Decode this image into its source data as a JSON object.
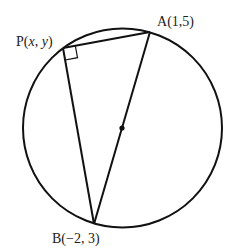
{
  "diagram": {
    "type": "circle-geometry",
    "circle": {
      "cx": 122.5,
      "cy": 128,
      "r": 99.5
    },
    "points": {
      "A": {
        "label_name": "A",
        "label_coords": "(1,5)",
        "x": 150,
        "y": 32
      },
      "B": {
        "label_name": "B",
        "label_coords": "(−2, 3)",
        "x": 94,
        "y": 224
      },
      "P": {
        "label_name": "P",
        "label_open": "(",
        "label_x": "x",
        "label_comma": ", ",
        "label_y": "y",
        "label_close": ")",
        "x": 63,
        "y": 48
      },
      "center": {
        "x": 122,
        "y": 128
      }
    },
    "segments": [
      "PA",
      "PB",
      "AB"
    ],
    "right_angle_at": "P",
    "colors": {
      "stroke": "#111111",
      "text": "#222222",
      "background": "#ffffff"
    }
  }
}
